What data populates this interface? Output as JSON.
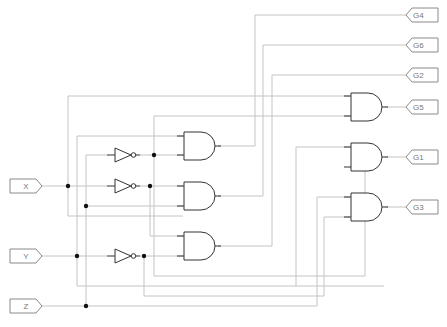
{
  "diagram": {
    "type": "logic-circuit",
    "colors": {
      "wire": "#bdbdbd",
      "gate": "#333333",
      "port": "#8a8a8a",
      "dot": "#111111",
      "background": "#ffffff"
    },
    "inputs": [
      {
        "id": "X",
        "label": "X",
        "y": 186
      },
      {
        "id": "Y",
        "label": "Y",
        "y": 256
      },
      {
        "id": "Z",
        "label": "Z",
        "y": 306
      }
    ],
    "outputs": [
      {
        "id": "G4",
        "label": "G4",
        "y": 15
      },
      {
        "id": "G6",
        "label": "G6",
        "y": 45
      },
      {
        "id": "G2",
        "label": "G2",
        "y": 75
      },
      {
        "id": "G5",
        "label": "G5",
        "y": 107
      },
      {
        "id": "G1",
        "label": "G1",
        "y": 157
      },
      {
        "id": "G3",
        "label": "G3",
        "y": 207
      }
    ],
    "gates": [
      {
        "id": "not1",
        "type": "NOT",
        "x": 115,
        "y": 155
      },
      {
        "id": "not2",
        "type": "NOT",
        "x": 115,
        "y": 186
      },
      {
        "id": "not3",
        "type": "NOT",
        "x": 115,
        "y": 256
      },
      {
        "id": "and1",
        "type": "AND",
        "x": 183,
        "y": 146
      },
      {
        "id": "and2",
        "type": "AND",
        "x": 183,
        "y": 196
      },
      {
        "id": "and3",
        "type": "AND",
        "x": 183,
        "y": 246
      },
      {
        "id": "and4",
        "type": "AND",
        "x": 350,
        "y": 107
      },
      {
        "id": "and5",
        "type": "AND",
        "x": 350,
        "y": 157
      },
      {
        "id": "and6",
        "type": "AND",
        "x": 350,
        "y": 207
      }
    ]
  }
}
